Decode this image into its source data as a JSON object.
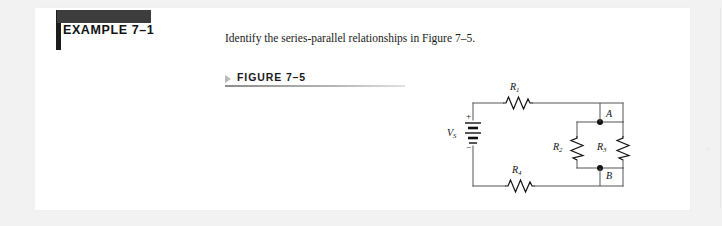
{
  "example": {
    "title": "EXAMPLE 7–1",
    "bar_color": "#3d3d3d",
    "accent_color": "#1c1c1c"
  },
  "body": {
    "prompt": "Identify the series-parallel relationships in Figure 7–5."
  },
  "figure": {
    "marker": "triangle-right",
    "label": "FIGURE 7–5"
  },
  "circuit": {
    "source": {
      "label": "V",
      "subscript": "S",
      "plus": "+",
      "minus": "−",
      "type": "dc-battery"
    },
    "resistors": [
      {
        "id": "R1",
        "label": "R",
        "subscript": "1",
        "orientation": "horizontal",
        "position": "top"
      },
      {
        "id": "R2",
        "label": "R",
        "subscript": "2",
        "orientation": "vertical",
        "position": "parallel-left"
      },
      {
        "id": "R3",
        "label": "R",
        "subscript": "3",
        "orientation": "vertical",
        "position": "parallel-right"
      },
      {
        "id": "R4",
        "label": "R",
        "subscript": "4",
        "orientation": "horizontal",
        "position": "bottom"
      }
    ],
    "nodes": [
      {
        "id": "A",
        "label": "A"
      },
      {
        "id": "B",
        "label": "B"
      }
    ],
    "wire_color": "#555555",
    "symbol_color": "#111111"
  },
  "page": {
    "background": "#f2f2f2",
    "sheet": "#ffffff"
  }
}
